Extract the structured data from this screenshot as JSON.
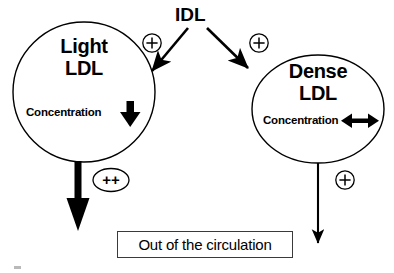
{
  "diagram": {
    "background_color": "#ffffff",
    "stroke_color": "#000000",
    "source_label": "IDL",
    "nodes": [
      {
        "id": "light-ldl",
        "title_line1": "Light",
        "title_line2": "LDL",
        "metric_label": "Concentration",
        "metric_indicator": "down-arrow-thick",
        "center_x": 84,
        "center_y": 92,
        "radius_x": 71,
        "radius_y": 70
      },
      {
        "id": "dense-ldl",
        "title_line1": "Dense",
        "title_line2": "LDL",
        "metric_label": "Concentration",
        "metric_indicator": "double-headed-horizontal-arrow",
        "center_x": 318,
        "center_y": 109,
        "radius_x": 66,
        "radius_y": 54
      }
    ],
    "edges": [
      {
        "id": "idl-to-light",
        "from": "IDL",
        "to": "Light LDL",
        "modifier": "+",
        "modifier_shape": "circle",
        "weight": "thin"
      },
      {
        "id": "idl-to-dense",
        "from": "IDL",
        "to": "Dense LDL",
        "modifier": "+",
        "modifier_shape": "circle",
        "weight": "thin"
      },
      {
        "id": "light-to-out",
        "from": "Light LDL",
        "to": "Out of the circulation",
        "modifier": "++",
        "modifier_shape": "ellipse",
        "weight": "thick"
      },
      {
        "id": "dense-to-out",
        "from": "Dense LDL",
        "to": "Out of the circulation",
        "modifier": "+",
        "modifier_shape": "circle",
        "weight": "thin"
      }
    ],
    "outcome_box": {
      "label": "Out of the circulation"
    }
  }
}
